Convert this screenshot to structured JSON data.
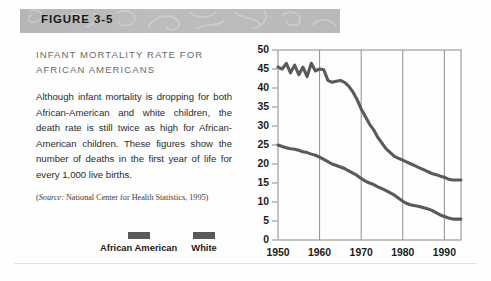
{
  "header": {
    "figure_label": "FIGURE 3-5"
  },
  "figure": {
    "heading": "INFANT MORTALITY RATE FOR\nAFRICAN AMERICANS",
    "body": "Although infant mortality is dropping for both African-American and white children, the death rate is still twice as high for African-American children. These figures show the number of deaths in the first year of life for every 1,000 live births.",
    "source_prefix": "(",
    "source_label": "Source:",
    "source_text": " National Center for Health Statistics, 1995)"
  },
  "legend": {
    "items": [
      {
        "label": "African American",
        "color": "#5a5a5a"
      },
      {
        "label": "White",
        "color": "#5a5a5a"
      }
    ]
  },
  "colors": {
    "header_band": "#b9b9b9",
    "heading_text": "#6b6b6b",
    "body_text": "#2b2b2b",
    "line": "#5a5a5a",
    "axis": "#888888",
    "gridline": "#8f8f8f"
  },
  "chart_data": {
    "type": "line",
    "title": "",
    "xlabel": "",
    "ylabel": "",
    "xlim": [
      1950,
      1994
    ],
    "ylim": [
      0,
      50
    ],
    "ytick_labels": [
      "0",
      "5",
      "10",
      "15",
      "20",
      "25",
      "30",
      "35",
      "40",
      "45",
      "50"
    ],
    "ytick_values": [
      0,
      5,
      10,
      15,
      20,
      25,
      30,
      35,
      40,
      45,
      50
    ],
    "xtick_labels": [
      "1950",
      "1960",
      "1970",
      "1980",
      "1990"
    ],
    "xtick_values": [
      1950,
      1960,
      1970,
      1980,
      1990
    ],
    "grid": "vertical",
    "legend_position": "below-left-column",
    "series": [
      {
        "name": "African American",
        "color": "#5a5a5a",
        "x": [
          1950,
          1951,
          1952,
          1953,
          1954,
          1955,
          1956,
          1957,
          1958,
          1959,
          1960,
          1961,
          1962,
          1963,
          1964,
          1965,
          1966,
          1967,
          1968,
          1969,
          1970,
          1971,
          1972,
          1973,
          1974,
          1975,
          1976,
          1977,
          1978,
          1979,
          1980,
          1981,
          1982,
          1983,
          1984,
          1985,
          1986,
          1987,
          1988,
          1989,
          1990,
          1991,
          1992,
          1993,
          1994
        ],
        "values": [
          45.5,
          45.0,
          46.5,
          44.0,
          46.0,
          43.5,
          45.5,
          43.0,
          46.5,
          44.5,
          45.0,
          44.8,
          42.0,
          41.5,
          41.8,
          42.0,
          41.5,
          40.5,
          39.0,
          37.0,
          34.5,
          32.5,
          30.5,
          29.0,
          27.0,
          25.5,
          24.0,
          23.0,
          22.0,
          21.5,
          21.0,
          20.5,
          20.0,
          19.5,
          19.0,
          18.5,
          18.0,
          17.5,
          17.2,
          16.8,
          16.5,
          16.0,
          15.8,
          15.8,
          15.8
        ]
      },
      {
        "name": "White",
        "color": "#5a5a5a",
        "x": [
          1950,
          1951,
          1952,
          1953,
          1954,
          1955,
          1956,
          1957,
          1958,
          1959,
          1960,
          1961,
          1962,
          1963,
          1964,
          1965,
          1966,
          1967,
          1968,
          1969,
          1970,
          1971,
          1972,
          1973,
          1974,
          1975,
          1976,
          1977,
          1978,
          1979,
          1980,
          1981,
          1982,
          1983,
          1984,
          1985,
          1986,
          1987,
          1988,
          1989,
          1990,
          1991,
          1992,
          1993,
          1994
        ],
        "values": [
          25.0,
          24.6,
          24.3,
          24.0,
          23.9,
          23.6,
          23.2,
          23.0,
          22.6,
          22.3,
          21.8,
          21.2,
          20.6,
          20.0,
          19.6,
          19.2,
          18.8,
          18.2,
          17.6,
          17.0,
          16.2,
          15.5,
          15.0,
          14.6,
          14.0,
          13.5,
          13.0,
          12.4,
          11.8,
          11.0,
          10.2,
          9.6,
          9.2,
          9.0,
          8.8,
          8.5,
          8.2,
          7.8,
          7.2,
          6.6,
          6.2,
          5.8,
          5.5,
          5.5,
          5.5
        ]
      }
    ]
  }
}
